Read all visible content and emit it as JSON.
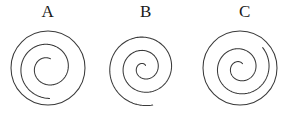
{
  "figure": {
    "title": "",
    "background_color": "#ffffff",
    "stroke_color": "#3a3a3a",
    "width": 288,
    "height": 118,
    "panels": [
      {
        "label": "A",
        "center_x": 48,
        "center_y": 48,
        "has_outer_circle": true,
        "outer_radius": 37,
        "spiral": {
          "type": "archimedean",
          "turns": 1.55,
          "start_angle_deg": 285,
          "r_start": 9.5,
          "r_end": 30.5,
          "direction": "counterclockwise"
        }
      },
      {
        "label": "B",
        "center_x": 48,
        "center_y": 48,
        "has_outer_circle": false,
        "outer_radius": 0,
        "spiral": {
          "type": "archimedean",
          "turns": 2.62,
          "start_angle_deg": 300,
          "r_start": 3.0,
          "r_end": 38.0,
          "direction": "counterclockwise"
        }
      },
      {
        "label": "C",
        "center_x": 48,
        "center_y": 48,
        "has_outer_circle": true,
        "outer_radius": 37,
        "spiral": {
          "type": "archimedean",
          "turns": 1.95,
          "start_angle_deg": 300,
          "r_start": 5.0,
          "r_end": 30.5,
          "direction": "counterclockwise"
        }
      }
    ]
  },
  "chart_data": {
    "type": "diagram",
    "title": "",
    "subtitle": "",
    "categories": [
      "A",
      "B",
      "C"
    ],
    "series": [
      {
        "name": "spiral_turns",
        "values": [
          1.55,
          2.62,
          1.95
        ]
      },
      {
        "name": "has_bounding_circle",
        "values": [
          1,
          0,
          1
        ]
      }
    ],
    "xlabel": "",
    "ylabel": "",
    "legend": [],
    "grid": false,
    "annotations": [
      "A",
      "B",
      "C"
    ]
  }
}
